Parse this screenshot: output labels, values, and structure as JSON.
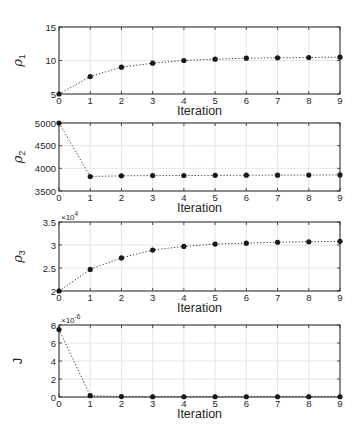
{
  "figure": {
    "width": 362,
    "height": 440,
    "colors": {
      "axis": "#262626",
      "grid": "#dedede",
      "marker": "#1a1a1a",
      "line": "#333333"
    }
  },
  "chart_data": [
    {
      "type": "line",
      "title": "",
      "xlabel": "Iteration",
      "ylabel": "ρ1",
      "ylabel_main": "ρ",
      "ylabel_sub": "1",
      "x": [
        0,
        1,
        2,
        3,
        4,
        5,
        6,
        7,
        8,
        9
      ],
      "values": [
        5.0,
        7.6,
        9.0,
        9.6,
        10.0,
        10.2,
        10.35,
        10.4,
        10.45,
        10.5
      ],
      "xlim": [
        0,
        9
      ],
      "ylim": [
        5,
        15
      ],
      "yticks": [
        5,
        10,
        15
      ],
      "ytick_labels": [
        "5",
        "10",
        "15"
      ],
      "exponent_label": "",
      "grid": true,
      "line_style": "dotted",
      "marker": "filled-circle",
      "box": {
        "top": 27,
        "bottom": 94
      }
    },
    {
      "type": "line",
      "title": "",
      "xlabel": "Iteration",
      "ylabel": "ρ2",
      "ylabel_main": "ρ",
      "ylabel_sub": "2",
      "x": [
        0,
        1,
        2,
        3,
        4,
        5,
        6,
        7,
        8,
        9
      ],
      "values": [
        5000,
        3820,
        3835,
        3840,
        3842,
        3845,
        3848,
        3850,
        3852,
        3855
      ],
      "xlim": [
        0,
        9
      ],
      "ylim": [
        3500,
        5000
      ],
      "yticks": [
        3500,
        4000,
        4500,
        5000
      ],
      "ytick_labels": [
        "3500",
        "4000",
        "4500",
        "5000"
      ],
      "exponent_label": "",
      "grid": true,
      "line_style": "dotted",
      "marker": "filled-circle",
      "box": {
        "top": 123,
        "bottom": 191
      }
    },
    {
      "type": "line",
      "title": "",
      "xlabel": "Iteration",
      "ylabel": "ρ3",
      "ylabel_main": "ρ",
      "ylabel_sub": "3",
      "x": [
        0,
        1,
        2,
        3,
        4,
        5,
        6,
        7,
        8,
        9
      ],
      "values": [
        2.0,
        2.47,
        2.72,
        2.89,
        2.97,
        3.02,
        3.04,
        3.06,
        3.07,
        3.08
      ],
      "value_scale": "x10^4",
      "xlim": [
        0,
        9
      ],
      "ylim": [
        2,
        3.5
      ],
      "yticks": [
        2,
        2.5,
        3,
        3.5
      ],
      "ytick_labels": [
        "2",
        "2.5",
        "3",
        "3.5"
      ],
      "exponent_label": "×10",
      "exponent_power": "4",
      "grid": true,
      "line_style": "dotted",
      "marker": "filled-circle",
      "box": {
        "top": 222,
        "bottom": 291
      }
    },
    {
      "type": "line",
      "title": "",
      "xlabel": "Iteration",
      "ylabel": "J",
      "ylabel_main": "J",
      "ylabel_sub": "",
      "x": [
        0,
        1,
        2,
        3,
        4,
        5,
        6,
        7,
        8,
        9
      ],
      "values": [
        7.5,
        0.15,
        0.05,
        0.03,
        0.03,
        0.03,
        0.03,
        0.03,
        0.03,
        0.03
      ],
      "value_scale": "x10^-6",
      "xlim": [
        0,
        9
      ],
      "ylim": [
        0,
        8
      ],
      "yticks": [
        0,
        2,
        4,
        6,
        8
      ],
      "ytick_labels": [
        "0",
        "2",
        "4",
        "6",
        "8"
      ],
      "exponent_label": "×10",
      "exponent_power": "-6",
      "grid": true,
      "line_style": "dotted",
      "marker": "filled-circle",
      "box": {
        "top": 325,
        "bottom": 397
      }
    }
  ],
  "xticks": [
    0,
    1,
    2,
    3,
    4,
    5,
    6,
    7,
    8,
    9
  ],
  "xtick_labels": [
    "0",
    "1",
    "2",
    "3",
    "4",
    "5",
    "6",
    "7",
    "8",
    "9"
  ],
  "plot_area": {
    "left": 59,
    "right": 340
  }
}
